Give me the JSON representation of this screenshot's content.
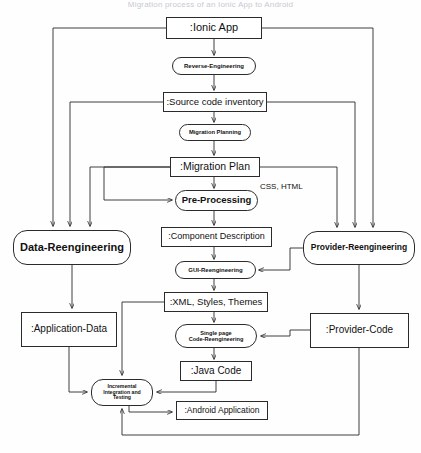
{
  "diagram": {
    "title": "Migration process of an Ionic App to Android",
    "type": "uml-activity-flow",
    "width": 421,
    "height": 453,
    "colors": {
      "stroke": "#2b2b2b",
      "node_fill": "#ffffff",
      "text": "#111111",
      "background": "#fefefe"
    }
  },
  "nodes": [
    {
      "id": "ionic-app",
      "label": ":Ionic App",
      "kind": "object",
      "x": 166,
      "y": 17,
      "w": 96,
      "h": 22,
      "font": 11
    },
    {
      "id": "reverse-engineering",
      "label": "Reverse-Engineering",
      "kind": "activity",
      "x": 172,
      "y": 57,
      "w": 84,
      "h": 18,
      "font": 6
    },
    {
      "id": "source-code-inventory",
      "label": ":Source code inventory",
      "kind": "object",
      "x": 163,
      "y": 92,
      "w": 104,
      "h": 20,
      "font": 9.5
    },
    {
      "id": "migration-planning",
      "label": "Migration Planning",
      "kind": "activity",
      "x": 179,
      "y": 124,
      "w": 72,
      "h": 17,
      "font": 5.8
    },
    {
      "id": "migration-plan",
      "label": ":Migration Plan",
      "kind": "object",
      "x": 170,
      "y": 157,
      "w": 90,
      "h": 20,
      "font": 10.5
    },
    {
      "id": "pre-processing",
      "label": "Pre-Processing",
      "kind": "activity",
      "x": 175,
      "y": 190,
      "w": 83,
      "h": 21,
      "font": 9.5
    },
    {
      "id": "component-description",
      "label": ":Component Description",
      "kind": "object",
      "x": 161,
      "y": 227,
      "w": 111,
      "h": 20,
      "font": 9
    },
    {
      "id": "gui-reengineering",
      "label": "GUI-Reengineering",
      "kind": "activity",
      "x": 175,
      "y": 261,
      "w": 81,
      "h": 18,
      "font": 6
    },
    {
      "id": "xml-styles-themes",
      "label": ":XML, Styles, Themes",
      "kind": "object",
      "x": 164,
      "y": 292,
      "w": 104,
      "h": 20,
      "font": 9.5
    },
    {
      "id": "single-page-code-reeng",
      "label": "Single page\nCode-Reengineering",
      "kind": "activity",
      "x": 175,
      "y": 324,
      "w": 82,
      "h": 24,
      "font": 5.6
    },
    {
      "id": "java-code",
      "label": ":Java Code",
      "kind": "object",
      "x": 180,
      "y": 361,
      "w": 72,
      "h": 20,
      "font": 10
    },
    {
      "id": "android-application",
      "label": ":Android Application",
      "kind": "object",
      "x": 176,
      "y": 401,
      "w": 92,
      "h": 19,
      "font": 8.5
    },
    {
      "id": "data-reengineering",
      "label": "Data-Reengineering",
      "kind": "big",
      "x": 13,
      "y": 230,
      "w": 118,
      "h": 35,
      "font": 11
    },
    {
      "id": "application-data",
      "label": ":Application-Data",
      "kind": "object",
      "x": 21,
      "y": 312,
      "w": 96,
      "h": 35,
      "font": 10
    },
    {
      "id": "incremental-testing",
      "label": "Incremental\nIntegration and\nTesting",
      "kind": "activity",
      "x": 91,
      "y": 379,
      "w": 62,
      "h": 27,
      "font": 5.2
    },
    {
      "id": "provider-reengineering",
      "label": "Provider-Reengineering",
      "kind": "big",
      "x": 303,
      "y": 231,
      "w": 112,
      "h": 34,
      "font": 8.5
    },
    {
      "id": "provider-code",
      "label": ":Provider-Code",
      "kind": "object",
      "x": 310,
      "y": 313,
      "w": 99,
      "h": 35,
      "font": 10
    }
  ],
  "edge_labels": [
    {
      "id": "css-html",
      "text": "CSS, HTML",
      "x": 260,
      "y": 182,
      "font": 8
    }
  ],
  "edges": [
    {
      "id": "ionic-to-reverse",
      "from": "ionic-app",
      "to": "reverse-engineering"
    },
    {
      "id": "reverse-to-inventory",
      "from": "reverse-engineering",
      "to": "source-code-inventory"
    },
    {
      "id": "inventory-to-planning",
      "from": "source-code-inventory",
      "to": "migration-planning"
    },
    {
      "id": "planning-to-plan",
      "from": "migration-planning",
      "to": "migration-plan"
    },
    {
      "id": "plan-to-preprocessing",
      "from": "migration-plan",
      "to": "pre-processing"
    },
    {
      "id": "preprocessing-to-component",
      "from": "pre-processing",
      "to": "component-description"
    },
    {
      "id": "component-to-gui",
      "from": "component-description",
      "to": "gui-reengineering"
    },
    {
      "id": "gui-to-xml",
      "from": "gui-reengineering",
      "to": "xml-styles-themes"
    },
    {
      "id": "xml-to-singlepage",
      "from": "xml-styles-themes",
      "to": "single-page-code-reeng"
    },
    {
      "id": "singlepage-to-java",
      "from": "single-page-code-reeng",
      "to": "java-code"
    },
    {
      "id": "ionic-to-data-reeng",
      "from": "ionic-app",
      "to": "data-reengineering"
    },
    {
      "id": "inventory-to-data-reeng",
      "from": "source-code-inventory",
      "to": "data-reengineering"
    },
    {
      "id": "plan-to-data-reeng",
      "from": "migration-plan",
      "to": "data-reengineering"
    },
    {
      "id": "ionic-to-provider-reeng",
      "from": "ionic-app",
      "to": "provider-reengineering"
    },
    {
      "id": "inventory-to-provider-reeng",
      "from": "source-code-inventory",
      "to": "provider-reengineering"
    },
    {
      "id": "plan-to-provider-reeng",
      "from": "migration-plan",
      "to": "provider-reengineering"
    },
    {
      "id": "data-reeng-to-appdata",
      "from": "data-reengineering",
      "to": "application-data"
    },
    {
      "id": "provider-reeng-to-code",
      "from": "provider-reengineering",
      "to": "provider-code"
    },
    {
      "id": "provider-reeng-to-gui",
      "from": "provider-reengineering",
      "to": "gui-reengineering"
    },
    {
      "id": "provider-code-to-singlepage",
      "from": "provider-code",
      "to": "single-page-code-reeng"
    },
    {
      "id": "appdata-to-incremental",
      "from": "application-data",
      "to": "incremental-testing"
    },
    {
      "id": "xml-to-incremental",
      "from": "xml-styles-themes",
      "to": "incremental-testing"
    },
    {
      "id": "java-to-incremental",
      "from": "java-code",
      "to": "incremental-testing"
    },
    {
      "id": "incremental-to-android",
      "from": "incremental-testing",
      "to": "android-application"
    },
    {
      "id": "provider-code-to-incremental",
      "from": "provider-code",
      "to": "incremental-testing"
    },
    {
      "id": "preprocessing-feedback",
      "from": "migration-plan",
      "to": "pre-processing"
    }
  ]
}
